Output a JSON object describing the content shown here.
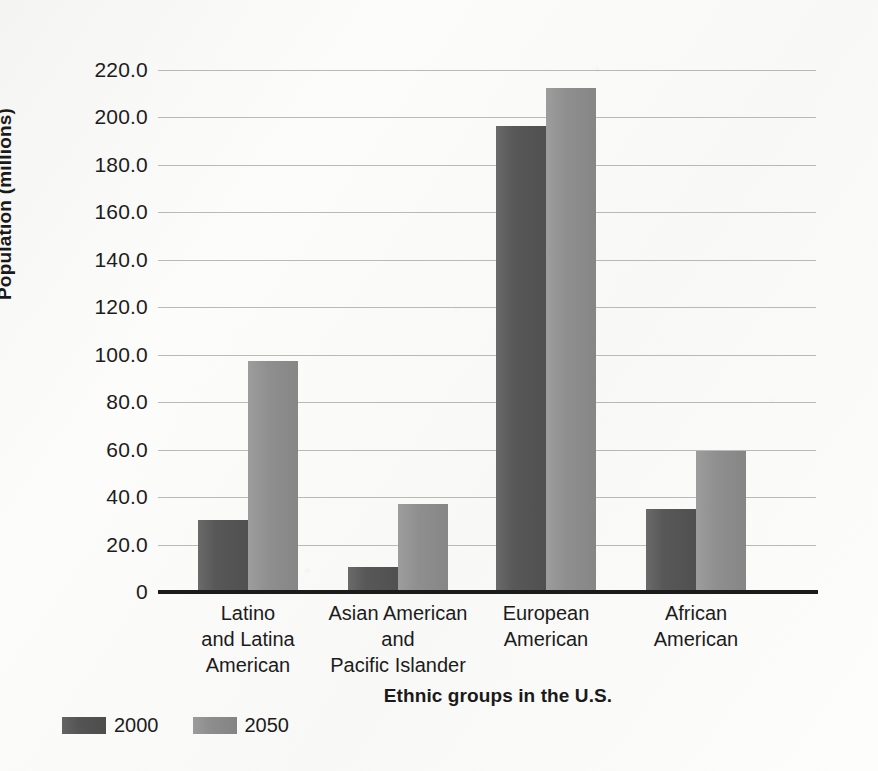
{
  "chart_data": {
    "type": "bar",
    "title": "",
    "xlabel": "Ethnic groups in the U.S.",
    "ylabel": "Population (millions)",
    "ylim": [
      0,
      220
    ],
    "ytick_values": [
      0,
      20,
      40,
      60,
      80,
      100,
      120,
      140,
      160,
      180,
      200,
      220
    ],
    "ytick_labels": [
      "0",
      "20.0",
      "40.0",
      "60.0",
      "80.0",
      "100.0",
      "120.0",
      "140.0",
      "160.0",
      "180.0",
      "200.0",
      "220.0"
    ],
    "grid": true,
    "legend_position": "bottom-left",
    "categories": [
      "Latino\nand Latina\nAmerican",
      "Asian American\nand\nPacific Islander",
      "European\nAmerican",
      "African\nAmerican"
    ],
    "category_lines": [
      [
        "Latino",
        "and Latina",
        "American"
      ],
      [
        "Asian American",
        "and",
        "Pacific Islander"
      ],
      [
        "European",
        "American"
      ],
      [
        "African",
        "American"
      ]
    ],
    "series": [
      {
        "name": "2000",
        "color": "#565656",
        "values": [
          30.5,
          10.5,
          196.5,
          35.0
        ]
      },
      {
        "name": "2050",
        "color": "#8e8e8e",
        "values": [
          97.5,
          37.0,
          212.5,
          59.5
        ]
      }
    ]
  },
  "legend": {
    "items": [
      {
        "label": "2000",
        "swatch_class": "s2000"
      },
      {
        "label": "2050",
        "swatch_class": "s2050"
      }
    ]
  },
  "axes": {
    "y_title": "Population (millions)",
    "x_title": "Ethnic groups in the U.S."
  }
}
